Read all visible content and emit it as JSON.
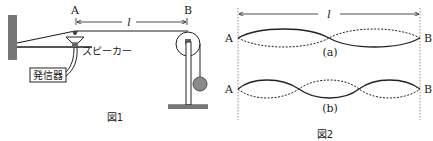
{
  "figure1": {
    "caption": "図1",
    "label_A": "A",
    "label_B": "B",
    "length_label": "l",
    "speaker_label": "スピーカー",
    "oscillator_label": "発信器"
  },
  "figure2": {
    "caption": "図2",
    "length_label": "l",
    "panel_a": {
      "label": "(a)",
      "left": "A",
      "right": "B",
      "loops": 2
    },
    "panel_b": {
      "label": "(b)",
      "left": "A",
      "right": "B",
      "loops": 3
    }
  },
  "colors": {
    "line": "#222222",
    "ground": "#888888",
    "weight": "#8a8a8a"
  }
}
